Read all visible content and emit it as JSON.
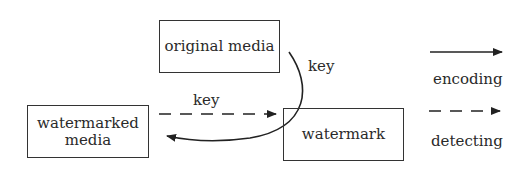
{
  "nodes": {
    "original_media": "original media",
    "watermarked_media_line1": "watermarked",
    "watermarked_media_line2": "media",
    "watermark": "watermark"
  },
  "edges": {
    "encoding_key_label": "key",
    "detecting_key_label": "key"
  },
  "legend": {
    "encoding": "encoding",
    "detecting": "detecting"
  }
}
